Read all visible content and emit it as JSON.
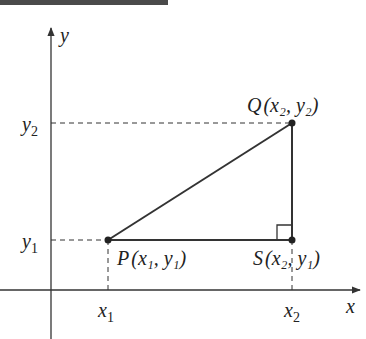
{
  "banner": {
    "text": "FIGURE 1.5",
    "color": "#4a4a4a"
  },
  "axes": {
    "x_label": "x",
    "y_label": "y"
  },
  "ticks": {
    "x1": {
      "base": "x",
      "sub": "1"
    },
    "x2": {
      "base": "x",
      "sub": "2"
    },
    "y1": {
      "base": "y",
      "sub": "1"
    },
    "y2": {
      "base": "y",
      "sub": "2"
    }
  },
  "points": {
    "P": {
      "name": "P",
      "label": "(x₁, y₁)"
    },
    "Q": {
      "name": "Q",
      "label": "(x₂, y₂)"
    },
    "S": {
      "name": "S",
      "label": "(x₂, y₁)"
    }
  },
  "colors": {
    "line": "#333333",
    "dashed": "#333333",
    "axis": "#333333"
  }
}
